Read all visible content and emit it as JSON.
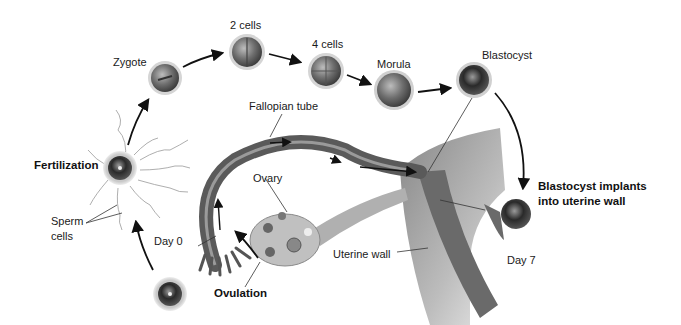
{
  "diagram": {
    "stages": {
      "zygote": "Zygote",
      "two_cells": "2 cells",
      "four_cells": "4 cells",
      "morula": "Morula",
      "blastocyst": "Blastocyst"
    },
    "labels": {
      "fertilization": "Fertilization",
      "sperm_cells_line1": "Sperm",
      "sperm_cells_line2": "cells",
      "fallopian_tube": "Fallopian tube",
      "ovary": "Ovary",
      "day0": "Day 0",
      "ovulation": "Ovulation",
      "uterine_wall": "Uterine wall",
      "implant_line1": "Blastocyst implants",
      "implant_line2": "into uterine wall",
      "day7": "Day 7"
    },
    "colors": {
      "tissue_dark": "#5a5a5a",
      "tissue_mid": "#8a8a8a",
      "tissue_light": "#c8c8c8",
      "arrow": "#111111",
      "text": "#1a1a1a"
    }
  }
}
